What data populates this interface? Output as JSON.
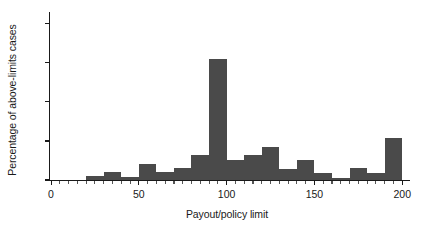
{
  "chart_data": {
    "type": "bar",
    "title": "",
    "subtitle": "",
    "xlabel": "Payout/policy limit",
    "ylabel": "Percentage of above-limits cases",
    "xlim": [
      0,
      205
    ],
    "ylim": [
      0,
      43
    ],
    "grid": false,
    "legend": null,
    "bar_color": "#4a4a4a",
    "axis_color": "#1a1a1a",
    "bin_width": 10,
    "xticks": [
      {
        "value": 0,
        "label": "0",
        "major": true
      },
      {
        "value": 10,
        "label": "",
        "major": false
      },
      {
        "value": 20,
        "label": "",
        "major": false
      },
      {
        "value": 30,
        "label": "",
        "major": false
      },
      {
        "value": 40,
        "label": "",
        "major": false
      },
      {
        "value": 50,
        "label": "50",
        "major": true
      },
      {
        "value": 60,
        "label": "",
        "major": false
      },
      {
        "value": 70,
        "label": "",
        "major": false
      },
      {
        "value": 80,
        "label": "",
        "major": false
      },
      {
        "value": 90,
        "label": "",
        "major": false
      },
      {
        "value": 100,
        "label": "100",
        "major": true
      },
      {
        "value": 110,
        "label": "",
        "major": false
      },
      {
        "value": 120,
        "label": "",
        "major": false
      },
      {
        "value": 130,
        "label": "",
        "major": false
      },
      {
        "value": 140,
        "label": "",
        "major": false
      },
      {
        "value": 150,
        "label": "150",
        "major": true
      },
      {
        "value": 160,
        "label": "",
        "major": false
      },
      {
        "value": 170,
        "label": "",
        "major": false
      },
      {
        "value": 180,
        "label": "",
        "major": false
      },
      {
        "value": 190,
        "label": "",
        "major": false
      },
      {
        "value": 200,
        "label": "200",
        "major": true
      }
    ],
    "yticks": [
      {
        "value": 0,
        "label": "0"
      },
      {
        "value": 10,
        "label": "10"
      },
      {
        "value": 20,
        "label": "20"
      },
      {
        "value": 30,
        "label": "30"
      },
      {
        "value": 40,
        "label": "40"
      }
    ],
    "bins": [
      {
        "x0": 20,
        "x1": 30,
        "value": 1.0
      },
      {
        "x0": 30,
        "x1": 40,
        "value": 2.0
      },
      {
        "x0": 40,
        "x1": 50,
        "value": 0.8
      },
      {
        "x0": 50,
        "x1": 60,
        "value": 4.2
      },
      {
        "x0": 60,
        "x1": 70,
        "value": 2.0
      },
      {
        "x0": 70,
        "x1": 80,
        "value": 3.0
      },
      {
        "x0": 80,
        "x1": 90,
        "value": 6.3
      },
      {
        "x0": 90,
        "x1": 100,
        "value": 31.0
      },
      {
        "x0": 100,
        "x1": 110,
        "value": 5.2
      },
      {
        "x0": 110,
        "x1": 120,
        "value": 6.3
      },
      {
        "x0": 120,
        "x1": 130,
        "value": 8.4
      },
      {
        "x0": 130,
        "x1": 140,
        "value": 2.8
      },
      {
        "x0": 140,
        "x1": 150,
        "value": 5.2
      },
      {
        "x0": 150,
        "x1": 160,
        "value": 1.9
      },
      {
        "x0": 160,
        "x1": 170,
        "value": 0.6
      },
      {
        "x0": 170,
        "x1": 180,
        "value": 3.0
      },
      {
        "x0": 180,
        "x1": 190,
        "value": 1.9
      },
      {
        "x0": 190,
        "x1": 200,
        "value": 10.7
      }
    ],
    "categories": [
      "20-30",
      "30-40",
      "40-50",
      "50-60",
      "60-70",
      "70-80",
      "80-90",
      "90-100",
      "100-110",
      "110-120",
      "120-130",
      "130-140",
      "140-150",
      "150-160",
      "160-170",
      "170-180",
      "180-190",
      "190-200"
    ],
    "values": [
      1.0,
      2.0,
      0.8,
      4.2,
      2.0,
      3.0,
      6.3,
      31.0,
      5.2,
      6.3,
      8.4,
      2.8,
      5.2,
      1.9,
      0.6,
      3.0,
      1.9,
      10.7
    ]
  }
}
